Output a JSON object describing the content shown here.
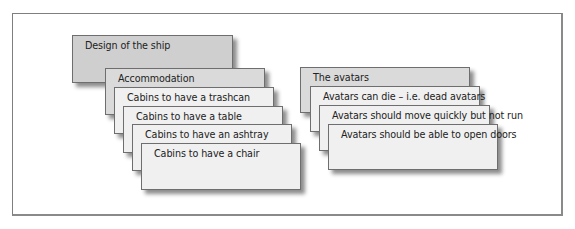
{
  "diagram": {
    "left_group": {
      "root": "Design of the ship",
      "category": "Accommodation",
      "items": [
        "Cabins to have a trashcan",
        "Cabins to have a table",
        "Cabins to have an ashtray",
        "Cabins to have a chair"
      ]
    },
    "right_group": {
      "category": "The avatars",
      "items": [
        "Avatars can die – i.e. dead avatars",
        "Avatars should move quickly but not run",
        "Avatars should be able to open doors"
      ]
    }
  }
}
